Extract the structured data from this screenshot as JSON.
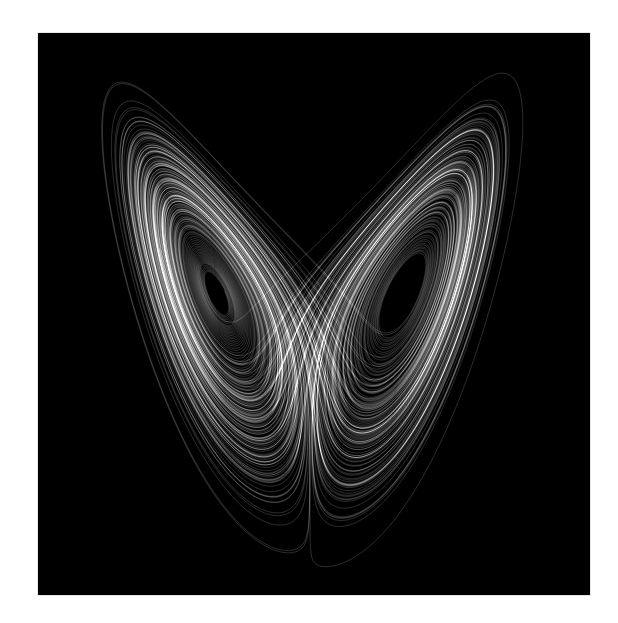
{
  "image": {
    "subject": "Lorenz attractor (butterfly), x–z projection",
    "background_color": "#ffffff",
    "frame_color": "#000000",
    "stroke_color": "#d8d8d8"
  },
  "attractor": {
    "sigma": 10,
    "rho": 28,
    "beta": 2.6666667,
    "dt": 0.004,
    "steps": 60000,
    "skip": 500,
    "start": [
      0.1,
      0.0,
      0.0
    ],
    "projection": {
      "center_px_x": 310,
      "zero_px_y": 585,
      "scale_x": 11.0,
      "scale_z": 10.8
    },
    "stroke_alpha": 0.32,
    "stroke_width": 0.6
  }
}
